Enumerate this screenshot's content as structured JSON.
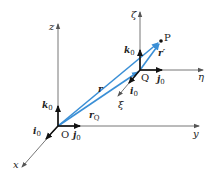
{
  "diagram": {
    "colors": {
      "axis": "#555555",
      "vector": "#3a8fd6",
      "unit_vector": "#111111",
      "background": "#ffffff"
    },
    "frame_fixed": {
      "origin_label": "O",
      "axes": {
        "x": "x",
        "y": "y",
        "z": "z"
      },
      "unit_vectors": {
        "i": "i",
        "j": "j",
        "k": "k",
        "subscript": "0"
      }
    },
    "frame_moving": {
      "origin_label": "Q",
      "axes": {
        "xi": "ξ",
        "eta": "η",
        "zeta": "ζ"
      },
      "unit_vectors": {
        "i": "i",
        "j": "j",
        "k": "k",
        "subscript": "0"
      }
    },
    "point": {
      "label": "P"
    },
    "vectors": {
      "r": "r",
      "rQ_main": "r",
      "rQ_sub": "Q",
      "r_prime": "r′"
    }
  }
}
